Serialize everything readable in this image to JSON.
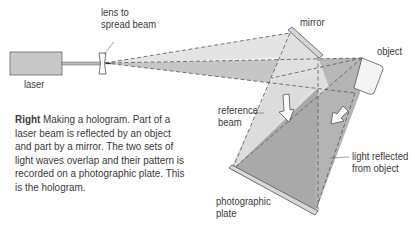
{
  "labels": {
    "laser": "laser",
    "lens": "lens to\nspread beam",
    "mirror": "mirror",
    "object": "object",
    "reference_beam": "reference\nbeam",
    "light_reflected": "light reflected\nfrom object",
    "photographic_plate": "photographic\nplate"
  },
  "caption": {
    "lead": "Right",
    "text": " Making a hologram. Part of a laser beam is reflected by an object and part by a mirror. The two sets of light waves overlap and their pattern is recorded on a photographic plate. This is the hologram."
  },
  "colors": {
    "light_beam": "#e2e2e2",
    "mid_beam": "#c4c4c4",
    "dark_beam": "#a8a8a8",
    "outline": "#555555"
  }
}
